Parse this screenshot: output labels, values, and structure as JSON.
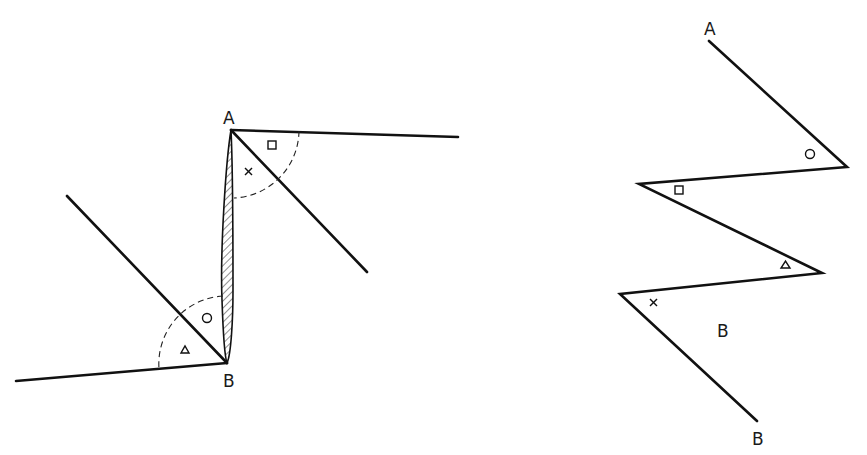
{
  "figure": {
    "left": {
      "labels": {
        "top": "A",
        "bottom": "B"
      },
      "angle_marks_at_A": [
        "square",
        "cross"
      ],
      "angle_marks_at_B": [
        "circle",
        "triangle"
      ],
      "hatched_segment": "A-B (transversal, shaded)"
    },
    "right": {
      "labels": {
        "top": "A",
        "middle": "B",
        "bottom": "B"
      },
      "angle_marks": [
        "circle",
        "square",
        "triangle",
        "cross"
      ]
    }
  }
}
